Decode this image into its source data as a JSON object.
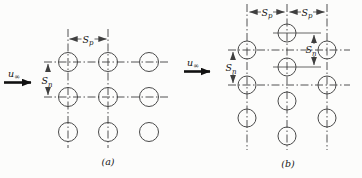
{
  "figure": {
    "title_hint": "tube-bank-arrangements",
    "colors": {
      "background": "#fcfcfb",
      "line": "#3f3f3f",
      "text": "#141414"
    },
    "labels": {
      "u_inf": {
        "base": "u",
        "sub": "∞"
      },
      "s_p": {
        "base": "S",
        "sub": "p"
      },
      "s_n": {
        "base": "S",
        "sub": "n"
      }
    },
    "captions": {
      "a": "(a)",
      "b": "(b)"
    }
  }
}
